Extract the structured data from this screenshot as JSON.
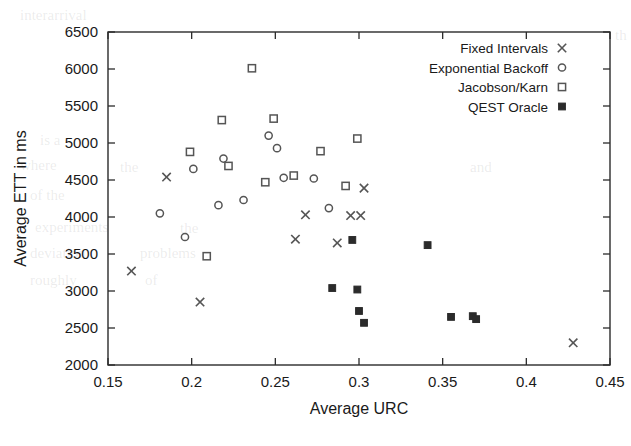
{
  "chart_data": {
    "type": "scatter",
    "title": "",
    "xlabel": "Average URC",
    "ylabel": "Average ETT in ms",
    "xlim": [
      0.15,
      0.45
    ],
    "ylim": [
      2000,
      6500
    ],
    "xticks": [
      "0.15",
      "0.2",
      "0.25",
      "0.3",
      "0.35",
      "0.4",
      "0.45"
    ],
    "xtick_values": [
      0.15,
      0.2,
      0.25,
      0.3,
      0.35,
      0.4,
      0.45
    ],
    "yticks": [
      "2000",
      "2500",
      "3000",
      "3500",
      "4000",
      "4500",
      "5000",
      "5500",
      "6000",
      "6500"
    ],
    "ytick_values": [
      2000,
      2500,
      3000,
      3500,
      4000,
      4500,
      5000,
      5500,
      6000,
      6500
    ],
    "grid": false,
    "legend_position": "top-right",
    "series": [
      {
        "name": "Fixed Intervals",
        "marker": "cross",
        "points": [
          [
            0.164,
            3270
          ],
          [
            0.185,
            4540
          ],
          [
            0.205,
            2850
          ],
          [
            0.262,
            3700
          ],
          [
            0.268,
            4030
          ],
          [
            0.287,
            3650
          ],
          [
            0.295,
            4020
          ],
          [
            0.301,
            4020
          ],
          [
            0.303,
            4390
          ],
          [
            0.428,
            2300
          ]
        ]
      },
      {
        "name": "Exponential Backoff",
        "marker": "circle",
        "points": [
          [
            0.181,
            4050
          ],
          [
            0.196,
            3730
          ],
          [
            0.201,
            4650
          ],
          [
            0.216,
            4160
          ],
          [
            0.219,
            4790
          ],
          [
            0.231,
            4230
          ],
          [
            0.246,
            5100
          ],
          [
            0.251,
            4930
          ],
          [
            0.255,
            4530
          ],
          [
            0.273,
            4520
          ],
          [
            0.282,
            4120
          ]
        ]
      },
      {
        "name": "Jacobson/Karn",
        "marker": "square-open",
        "points": [
          [
            0.199,
            4880
          ],
          [
            0.209,
            3470
          ],
          [
            0.218,
            5310
          ],
          [
            0.222,
            4690
          ],
          [
            0.236,
            6010
          ],
          [
            0.244,
            4470
          ],
          [
            0.249,
            5330
          ],
          [
            0.261,
            4560
          ],
          [
            0.277,
            4890
          ],
          [
            0.292,
            4420
          ],
          [
            0.299,
            5060
          ]
        ]
      },
      {
        "name": "QEST Oracle",
        "marker": "square-filled",
        "points": [
          [
            0.284,
            3040
          ],
          [
            0.296,
            3690
          ],
          [
            0.299,
            3020
          ],
          [
            0.3,
            2730
          ],
          [
            0.303,
            2570
          ],
          [
            0.341,
            3620
          ],
          [
            0.355,
            2650
          ],
          [
            0.368,
            2660
          ],
          [
            0.37,
            2620
          ]
        ]
      }
    ]
  },
  "legend": {
    "entries": [
      {
        "label": "Fixed Intervals",
        "marker": "cross"
      },
      {
        "label": "Exponential Backoff",
        "marker": "circle"
      },
      {
        "label": "Jacobson/Karn",
        "marker": "square-open"
      },
      {
        "label": "QEST Oracle",
        "marker": "square-filled"
      }
    ]
  },
  "bleedthrough": [
    {
      "text": "interarrival",
      "x": 20,
      "y": 20
    },
    {
      "text": "th",
      "x": 615,
      "y": 40
    },
    {
      "text": "is a",
      "x": 40,
      "y": 145
    },
    {
      "text": "where",
      "x": 20,
      "y": 170
    },
    {
      "text": "the",
      "x": 120,
      "y": 172
    },
    {
      "text": "and",
      "x": 470,
      "y": 172
    },
    {
      "text": "of the",
      "x": 30,
      "y": 200
    },
    {
      "text": "experiments",
      "x": 35,
      "y": 232
    },
    {
      "text": "the",
      "x": 180,
      "y": 233
    },
    {
      "text": "deviation",
      "x": 30,
      "y": 258
    },
    {
      "text": "problems",
      "x": 140,
      "y": 258
    },
    {
      "text": "roughly",
      "x": 30,
      "y": 285
    },
    {
      "text": "of",
      "x": 145,
      "y": 285
    }
  ]
}
